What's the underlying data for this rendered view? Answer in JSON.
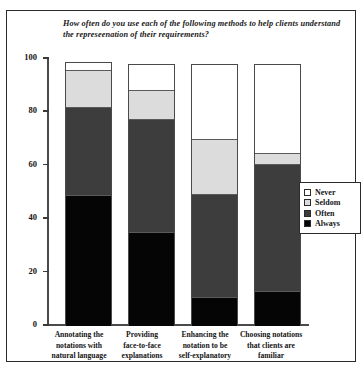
{
  "chart_data": {
    "type": "bar",
    "title": "How often do you use each of the following methods to help clients understand the represeenation of their requirements?",
    "title_line1": "How often do you use each of the following methods to help clients",
    "title_line2": "understand the represeenation of their requirements?",
    "xlabel": "",
    "ylabel": "",
    "ylim": [
      0,
      100
    ],
    "yticks": [
      0,
      20,
      40,
      60,
      80,
      100
    ],
    "ytick_labels": [
      "0",
      "20",
      "40",
      "60",
      "80",
      "100"
    ],
    "grid": false,
    "stacked": true,
    "legend_position": "right",
    "categories": [
      "Annotating the notations with natural language",
      "Providing face-to-face explanations",
      "Enhancing the notation to be self-explanatory",
      "Choosing notations that clients are familiar"
    ],
    "category_lines": [
      [
        "Annotating the",
        "notations with",
        "natural language"
      ],
      [
        "Providing",
        "face-to-face",
        "explanations"
      ],
      [
        "Enhancing the",
        "notation to be",
        "self-explanatory"
      ],
      [
        "Choosing notations",
        "that clients are",
        "familiar"
      ]
    ],
    "series": [
      {
        "name": "Always",
        "color": "#050505",
        "values": [
          49,
          35,
          10.5,
          13
        ]
      },
      {
        "name": "Often",
        "color": "#3d3d3d",
        "values": [
          33,
          42.5,
          38.5,
          47.5
        ]
      },
      {
        "name": "Seldom",
        "color": "#dcdcdc",
        "values": [
          13.5,
          10.5,
          20.5,
          3.5
        ]
      },
      {
        "name": "Never",
        "color": "#ffffff",
        "values": [
          2.5,
          9.5,
          28,
          33.5
        ]
      }
    ],
    "bar_totals": [
      98,
      97.5,
      97.5,
      97.5
    ]
  },
  "legend": {
    "items": [
      {
        "label": "Never",
        "color": "#ffffff"
      },
      {
        "label": "Seldom",
        "color": "#dcdcdc"
      },
      {
        "label": "Often",
        "color": "#3d3d3d"
      },
      {
        "label": "Always",
        "color": "#050505"
      }
    ]
  }
}
